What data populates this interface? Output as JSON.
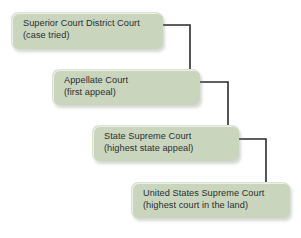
{
  "diagram": {
    "background_color": "#ffffff",
    "node_fill_color": "#c9d5bd",
    "node_text_color": "#2a2f33",
    "connector_color": "#2b2b2b",
    "nodes": [
      {
        "id": "superior-district-court",
        "line1": "Superior Court District Court",
        "line2": "(case tried)"
      },
      {
        "id": "appellate-court",
        "line1": "Appellate Court",
        "line2": "(first appeal)"
      },
      {
        "id": "state-supreme-court",
        "line1": "State Supreme Court",
        "line2": "(highest state appeal)"
      },
      {
        "id": "united-states-supreme-court",
        "line1": "United States Supreme Court",
        "line2": "(highest court in the land)"
      }
    ],
    "connectors": [
      {
        "from": "superior-district-court",
        "to": "appellate-court"
      },
      {
        "from": "appellate-court",
        "to": "state-supreme-court"
      },
      {
        "from": "state-supreme-court",
        "to": "united-states-supreme-court"
      }
    ]
  }
}
